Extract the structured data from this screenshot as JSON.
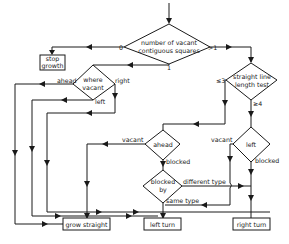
{
  "diagram": {
    "type": "flowchart",
    "nodes": {
      "number_vacant": {
        "line1": "number of vacant",
        "line2": "contiguous squares"
      },
      "stop_growth": {
        "line1": "stop",
        "line2": "growth"
      },
      "where_vacant": {
        "line1": "where",
        "line2": "vacant"
      },
      "straight_line_test": {
        "line1": "straight line",
        "line2": "length test"
      },
      "ahead": {
        "label": "ahead"
      },
      "left": {
        "label": "left"
      },
      "blocked_by": {
        "line1": "blocked",
        "line2": "by"
      },
      "grow_straight": {
        "label": "grow straight"
      },
      "left_turn": {
        "label": "left turn"
      },
      "right_turn": {
        "label": "right turn"
      }
    },
    "edge_labels": {
      "zero": "0",
      "gt_one": ">1",
      "one": "1",
      "ahead": "ahead",
      "right": "right",
      "left": "left",
      "le_three": "≤3",
      "ge_four": "≥4",
      "vacant_ahead": "vacant",
      "blocked_ahead": "blocked",
      "vacant_left": "vacant",
      "blocked_left": "blocked",
      "different_type": "different type",
      "same_type": "same type"
    },
    "colors": {
      "line": "#1a1a1a",
      "background": "#ffffff"
    }
  }
}
